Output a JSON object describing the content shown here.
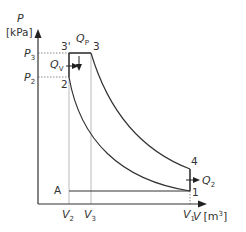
{
  "diagram": {
    "type": "P-V diagram (Sabathe / dual combustion cycle)",
    "axes": {
      "y_label": "P",
      "y_unit": "[kPa]",
      "x_label": "V",
      "x_unit": "[m",
      "x_unit_exp": "3",
      "x_unit_close": "]"
    },
    "y_ticks": {
      "p3": "P",
      "p3_sub": "3",
      "p2": "P",
      "p2_sub": "2"
    },
    "x_ticks": {
      "v2": "V",
      "v2_sub": "2",
      "v3": "V",
      "v3_sub": "3",
      "v1": "V",
      "v1_sub": "1"
    },
    "points": {
      "p1": "1",
      "p2": "2",
      "p3": "3",
      "p3prime": "3'",
      "p4": "4",
      "a": "A"
    },
    "heat_flows": {
      "qp": "Q",
      "qp_sub": "P",
      "qv": "Q",
      "qv_sub": "V",
      "q2": "Q",
      "q2_sub": "2"
    },
    "colors": {
      "line": "#333333",
      "guide": "#bbbbbb",
      "text": "#333333"
    }
  }
}
